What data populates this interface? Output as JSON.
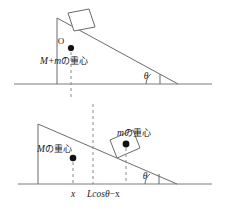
{
  "figure": {
    "colors": {
      "stroke": "#6b6b6b",
      "ground": "#7a7a7a",
      "dash": "#8a8a8a",
      "dot": "#111111",
      "text": "#1a1a1a",
      "background": "#ffffff"
    },
    "upper": {
      "name": "upper-diagram",
      "point_label": "O",
      "com_label_math": "M+m",
      "com_label_jp": "の重心",
      "angle_label": "θ"
    },
    "lower": {
      "name": "lower-diagram",
      "com_big_math": "M",
      "com_big_jp": "の重心",
      "com_small_math": "m",
      "com_small_jp": "の重心",
      "angle_label": "θ",
      "dim_left": "x",
      "dim_right_math": "Lcos",
      "dim_right_angle": "θ",
      "dim_right_tail": "−x"
    }
  }
}
